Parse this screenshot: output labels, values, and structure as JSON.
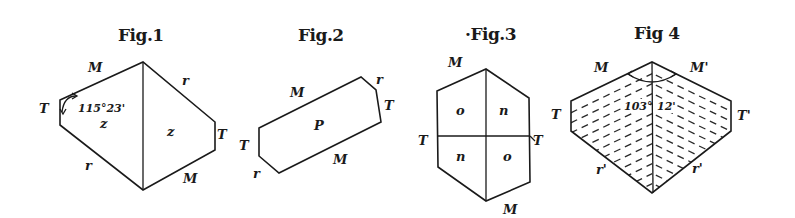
{
  "plate": {
    "background": "#ffffff",
    "ink": "#1a1a1a"
  },
  "figures": [
    {
      "title": "Fig.1",
      "labels": {
        "M_top": "M",
        "r_top_right": "r",
        "T_left": "T",
        "T_right": "T",
        "r_bottom_left": "r",
        "M_bottom": "M",
        "face_left": "z",
        "face_right": "z"
      },
      "angle": "115°23'"
    },
    {
      "title": "Fig.2",
      "labels": {
        "M_top": "M",
        "r_top_right": "r",
        "T_right": "T",
        "T_left": "T",
        "r_bottom_left": "r",
        "M_bottom": "M",
        "face": "P"
      }
    },
    {
      "title": "·Fig.3",
      "labels": {
        "M_top": "M",
        "T_left": "T",
        "T_right": "T",
        "M_bottom": "M",
        "face_tl": "o",
        "face_tr": "n",
        "face_bl": "n",
        "face_br": "o"
      }
    },
    {
      "title": "Fig 4",
      "labels": {
        "M_left": "M",
        "M_right": "M'",
        "T_left": "T",
        "T_right": "T'",
        "r_left": "r'",
        "r_right": "r'"
      },
      "angle_deg": "103°",
      "angle_min": "12'"
    }
  ]
}
